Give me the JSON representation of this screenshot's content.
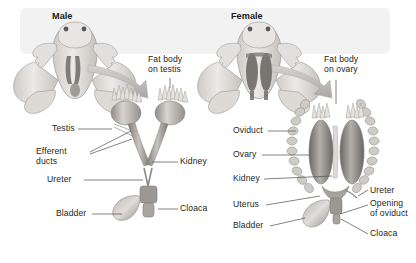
{
  "figure": {
    "title_partial": "",
    "panels": [
      {
        "id": "male",
        "heading": "Male",
        "labels": [
          {
            "name": "fat-body-on-testis",
            "text": "Fat body\non testis"
          },
          {
            "name": "testis",
            "text": "Testis"
          },
          {
            "name": "efferent-ducts",
            "text": "Efferent\nducts"
          },
          {
            "name": "ureter",
            "text": "Ureter"
          },
          {
            "name": "bladder",
            "text": "Bladder"
          },
          {
            "name": "kidney",
            "text": "Kidney"
          },
          {
            "name": "cloaca",
            "text": "Cloaca"
          }
        ]
      },
      {
        "id": "female",
        "heading": "Female",
        "labels": [
          {
            "name": "fat-body-on-ovary",
            "text": "Fat body\non ovary"
          },
          {
            "name": "oviduct",
            "text": "Oviduct"
          },
          {
            "name": "ovary",
            "text": "Ovary"
          },
          {
            "name": "kidney",
            "text": "Kidney"
          },
          {
            "name": "uterus",
            "text": "Uterus"
          },
          {
            "name": "bladder",
            "text": "Bladder"
          },
          {
            "name": "ureter",
            "text": "Ureter"
          },
          {
            "name": "opening-of-oviduct",
            "text": "Opening\nof oviduct"
          },
          {
            "name": "cloaca",
            "text": "Cloaca"
          }
        ]
      }
    ],
    "colors": {
      "background": "#ffffff",
      "panel": "#f2f2f3",
      "tissue_light": "#e3e1df",
      "tissue_mid": "#bdb9b5",
      "tissue_dark": "#8e8a86",
      "organ_dark": "#6f6b68",
      "leader": "#58595b",
      "text": "#231f20",
      "arrow": "#b9b7b5"
    }
  }
}
